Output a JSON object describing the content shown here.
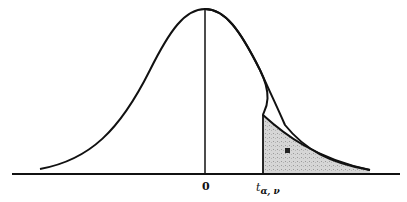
{
  "diagram": {
    "type": "t-distribution-right-tail",
    "labels": {
      "center": "0",
      "critical_value": "t",
      "critical_subscript": "α, ν",
      "tail_area": "α"
    },
    "colors": {
      "curve": "#111111",
      "shade": "#d4d4d4",
      "background": "#ffffff"
    }
  }
}
